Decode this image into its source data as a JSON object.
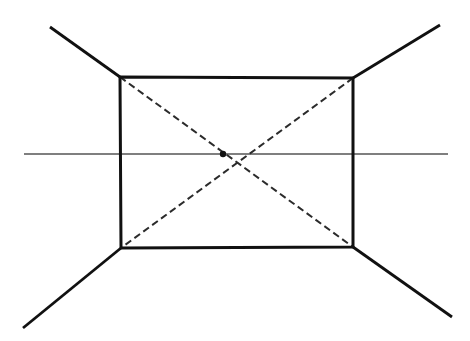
{
  "figure": {
    "type": "line-drawing",
    "width": 470,
    "height": 341,
    "background_color": "#ffffff"
  },
  "colors": {
    "ink": "#111111",
    "ink_soft": "#1a1a1a",
    "horizon": "#555555",
    "dashed": "#2b2b2b",
    "background": "#ffffff"
  },
  "strokes": {
    "rectangle_width": 3.0,
    "radial_width": 2.8,
    "dashed_width": 2.0,
    "horizon_width": 1.3,
    "dash_pattern": "7 4"
  },
  "geometry": {
    "rectangle": {
      "name": "front-face",
      "top_left": {
        "x": 120,
        "y": 77
      },
      "top_right": {
        "x": 353,
        "y": 78
      },
      "bottom_right": {
        "x": 353,
        "y": 247
      },
      "bottom_left": {
        "x": 121,
        "y": 248
      },
      "width": 233,
      "height": 171
    },
    "center_point": {
      "x": 223,
      "y": 154,
      "radius": 3.2
    },
    "horizon_line": {
      "name": "horizon",
      "x1": 24,
      "y1": 154,
      "x2": 448,
      "y2": 154
    },
    "diagonals_dashed": [
      {
        "name": "diagonal-tl-br",
        "x1": 120,
        "y1": 77,
        "x2": 353,
        "y2": 247
      },
      {
        "name": "diagonal-tr-bl",
        "x1": 353,
        "y1": 78,
        "x2": 121,
        "y2": 248
      }
    ],
    "radials_solid": [
      {
        "name": "radial-upper-left",
        "x1": 120,
        "y1": 77,
        "x2": 50,
        "y2": 27
      },
      {
        "name": "radial-upper-right",
        "x1": 353,
        "y1": 78,
        "x2": 440,
        "y2": 25
      },
      {
        "name": "radial-lower-left",
        "x1": 121,
        "y1": 248,
        "x2": 23,
        "y2": 328
      },
      {
        "name": "radial-lower-right",
        "x1": 353,
        "y1": 247,
        "x2": 452,
        "y2": 317
      }
    ]
  },
  "labels": {
    "figure_caption": ""
  }
}
